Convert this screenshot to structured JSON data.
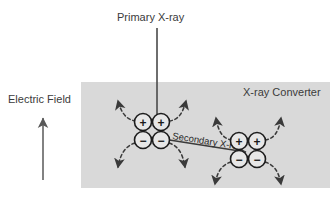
{
  "figure": {
    "kind": "schematic-diagram",
    "background_color": "#ffffff",
    "converter_fill": "#d9d9d9",
    "line_color": "#4a4a4a",
    "text_color": "#3b3b3b"
  },
  "labels": {
    "primary_xray": "Primary X-ray",
    "electric_field": "Electric Field",
    "converter": "X-ray Converter",
    "secondary_xray": "Secondary X-ray"
  },
  "charges": {
    "positive_sign": "+",
    "negative_sign": "−",
    "left_cluster": {
      "positive": [
        {
          "cx": 143,
          "cy": 122
        },
        {
          "cx": 161,
          "cy": 122
        }
      ],
      "negative": [
        {
          "cx": 143,
          "cy": 140
        },
        {
          "cx": 161,
          "cy": 140
        }
      ]
    },
    "right_cluster": {
      "positive": [
        {
          "cx": 239,
          "cy": 141
        },
        {
          "cx": 257,
          "cy": 141
        }
      ],
      "negative": [
        {
          "cx": 239,
          "cy": 159
        },
        {
          "cx": 257,
          "cy": 159
        }
      ]
    },
    "radius": 8.5
  },
  "drift_arrows": {
    "count": 8,
    "style": "dashed-curved",
    "description": "positive charges drift upward, negative charges drift downward along the electric field"
  },
  "converter_box": {
    "x": 81,
    "y": 82,
    "width": 249,
    "height": 106
  }
}
